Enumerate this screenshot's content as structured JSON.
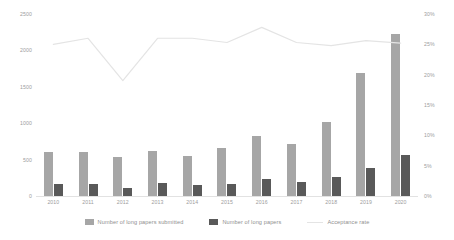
{
  "chart_data": {
    "type": "bar",
    "title": "",
    "xlabel": "",
    "ylabel": "",
    "categories": [
      "2010",
      "2011",
      "2012",
      "2013",
      "2014",
      "2015",
      "2016",
      "2017",
      "2018",
      "2019",
      "2020"
    ],
    "series": [
      {
        "name": "Number of long papers submitted",
        "type": "bar",
        "axis": "left",
        "color": "#a6a6a6",
        "values": [
          605,
          600,
          540,
          625,
          545,
          655,
          825,
          720,
          1020,
          1690,
          2220
        ]
      },
      {
        "name": "Number of long papers",
        "type": "bar",
        "axis": "left",
        "color": "#595959",
        "values": [
          160,
          165,
          110,
          175,
          150,
          170,
          230,
          195,
          255,
          385,
          570
        ]
      },
      {
        "name": "Acceptance rate",
        "type": "line",
        "axis": "right",
        "color": "#e4e4e4",
        "values": [
          25.0,
          26.0,
          19.0,
          26.0,
          26.0,
          25.3,
          27.8,
          25.3,
          24.8,
          25.6,
          25.2
        ]
      }
    ],
    "y_left": {
      "ticks": [
        "0",
        "500",
        "1000",
        "1500",
        "2000",
        "2500"
      ],
      "values": [
        0,
        500,
        1000,
        1500,
        2000,
        2500
      ],
      "ylim": [
        0,
        2500
      ]
    },
    "y_right": {
      "ticks": [
        "0%",
        "5%",
        "10%",
        "15%",
        "20%",
        "25%",
        "30%"
      ],
      "values": [
        0,
        5,
        10,
        15,
        20,
        25,
        30
      ],
      "ylim": [
        0,
        30
      ]
    },
    "grid": false,
    "legend_position": "bottom"
  },
  "legend": {
    "items": [
      {
        "label": "Number of long papers submitted",
        "marker": "light-swatch"
      },
      {
        "label": "Number of long papers",
        "marker": "dark-swatch"
      },
      {
        "label": "Acceptance rate",
        "marker": "line-swatch"
      }
    ]
  },
  "colors": {
    "submitted_bar": "#a6a6a6",
    "accepted_bar": "#595959",
    "rate_line": "#e4e4e4",
    "axis_text": "#9d9d9d",
    "background": "#ffffff"
  }
}
